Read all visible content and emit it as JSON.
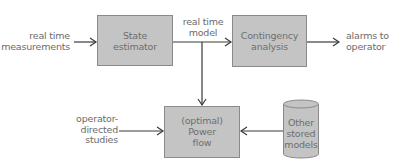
{
  "diagram": {
    "colors": {
      "box_fill": "#c4c4c4",
      "box_stroke": "#8a8a8a",
      "line": "#3a3a3a",
      "text": "#6b6b6b",
      "background": "#ffffff"
    },
    "nodes": {
      "state_estimator": {
        "line1": "State",
        "line2": "estimator"
      },
      "contingency_analysis": {
        "line1": "Contingency",
        "line2": "analysis"
      },
      "power_flow": {
        "line1": "(optimal)",
        "line2": "Power",
        "line3": "flow"
      },
      "stored_models": {
        "line1": "Other",
        "line2": "stored",
        "line3": "models"
      }
    },
    "labels": {
      "real_time_measurements": {
        "line1": "real time",
        "line2": "measurements"
      },
      "real_time_model": {
        "line1": "real time",
        "line2": "model"
      },
      "alarms_to_operator": {
        "line1": "alarms to",
        "line2": "operator"
      },
      "operator_directed_studies": {
        "line1": "operator-",
        "line2": "directed",
        "line3": "studies"
      }
    },
    "edges": [
      {
        "from": "real_time_measurements",
        "to": "state_estimator"
      },
      {
        "from": "state_estimator",
        "to": "contingency_analysis",
        "label": "real time model"
      },
      {
        "from": "state_estimator",
        "to": "power_flow",
        "label": "real time model"
      },
      {
        "from": "contingency_analysis",
        "to": "alarms_to_operator"
      },
      {
        "from": "operator_directed_studies",
        "to": "power_flow"
      },
      {
        "from": "stored_models",
        "to": "power_flow"
      }
    ]
  }
}
